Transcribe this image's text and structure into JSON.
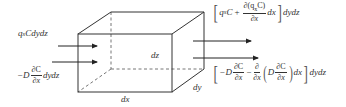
{
  "diagram": {
    "type": "control-volume-advection-dispersion",
    "colors": {
      "line": "#333333",
      "dashed": "#555555",
      "text": "#333333",
      "background": "#ffffff"
    },
    "cube": {
      "vertices": {
        "front_top_left": [
          78,
          34
        ],
        "front_top_right": [
          172,
          34
        ],
        "front_bottom_left": [
          78,
          92
        ],
        "front_bottom_right": [
          172,
          92
        ],
        "back_top_left": [
          111,
          12
        ],
        "back_top_right": [
          204,
          12
        ],
        "back_bottom_right": [
          204,
          69
        ],
        "back_bottom_left": [
          111,
          69
        ]
      },
      "hidden_edges": "dashed"
    },
    "dimension_labels": {
      "dx": "dx",
      "dy": "dy",
      "dz": "dz"
    },
    "inflow": {
      "advective_label": {
        "q": "q",
        "q_sub": "x",
        "rest": "Cdydz"
      },
      "dispersive_label": {
        "prefix": "−D",
        "num": "∂C",
        "den": "∂x",
        "suffix": "dydz"
      }
    },
    "outflow": {
      "advective": {
        "q": "q",
        "q_sub": "x",
        "c": "C",
        "plus": "+",
        "num": "∂(q",
        "num_sub": "x",
        "num_end": "C)",
        "den": "∂x",
        "dx": "dx",
        "suffix": "dydz"
      },
      "dispersive": {
        "prefix": "−D",
        "num1": "∂C",
        "den1": "∂x",
        "minus": "−",
        "num2": "∂",
        "den2": "∂x",
        "inner_D": "D",
        "num3": "∂C",
        "den3": "∂x",
        "dx": "dx",
        "suffix": "dydz"
      }
    },
    "arrows": [
      {
        "name": "inflow-advective",
        "from": [
          58,
          46
        ],
        "to": [
          97,
          46
        ]
      },
      {
        "name": "inflow-dispersive",
        "from": [
          52,
          62
        ],
        "to": [
          97,
          62
        ]
      },
      {
        "name": "outflow-advective",
        "from": [
          193,
          41
        ],
        "to": [
          251,
          41
        ]
      },
      {
        "name": "outflow-dispersive",
        "from": [
          193,
          58
        ],
        "to": [
          258,
          58
        ]
      }
    ]
  }
}
